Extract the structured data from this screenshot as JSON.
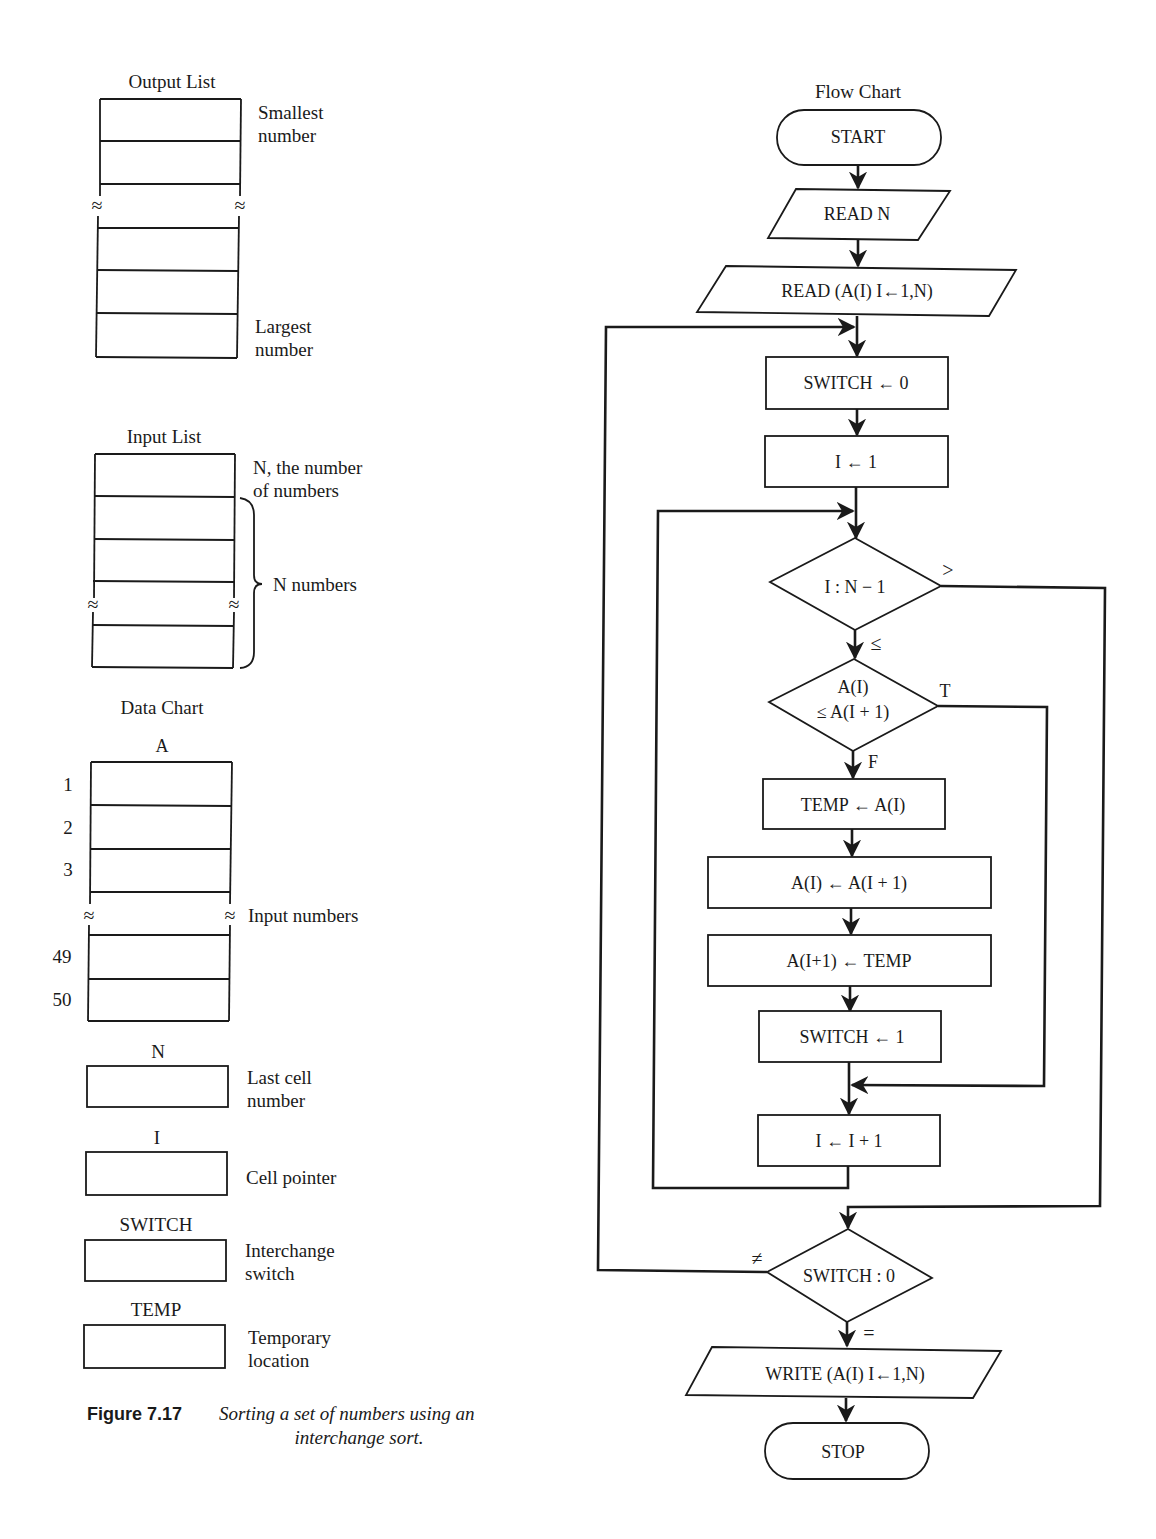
{
  "output_list": {
    "title": "Output List",
    "top_label": [
      "Smallest",
      "number"
    ],
    "bottom_label": [
      "Largest",
      "number"
    ],
    "break_symbol": "≈"
  },
  "input_list": {
    "title": "Input List",
    "first_label": [
      "N, the number",
      "of numbers"
    ],
    "brace_label": "N numbers",
    "break_symbol": "≈"
  },
  "data_chart": {
    "title": "Data Chart",
    "array_name": "A",
    "row_indices": [
      "1",
      "2",
      "3",
      "49",
      "50"
    ],
    "break_label": "Input numbers",
    "break_symbol": "≈",
    "variables": [
      {
        "name": "N",
        "label": [
          "Last cell",
          "number"
        ]
      },
      {
        "name": "I",
        "label": [
          "Cell pointer"
        ]
      },
      {
        "name": "SWITCH",
        "label": [
          "Interchange",
          "switch"
        ]
      },
      {
        "name": "TEMP",
        "label": [
          "Temporary",
          "location"
        ]
      }
    ]
  },
  "caption": {
    "figure_number": "Figure 7.17",
    "text_line1": "Sorting a set of numbers using an",
    "text_line2": "interchange sort."
  },
  "flow_chart": {
    "title": "Flow Chart",
    "start": "START",
    "read_n": "READ N",
    "read_a": "READ (A(I)  I←1,N)",
    "switch_zero": "SWITCH ← 0",
    "i_one": "I ← 1",
    "decision_i": "I : N − 1",
    "decision_i_gt": ">",
    "decision_i_le": "≤",
    "decision_a_line1": "A(I)",
    "decision_a_line2": "≤ A(I + 1)",
    "decision_a_true": "T",
    "decision_a_false": "F",
    "temp_assign": "TEMP ← A(I)",
    "a_assign": "A(I) ← A(I + 1)",
    "a_next_assign": "A(I+1) ← TEMP",
    "switch_one": "SWITCH ← 1",
    "i_increment": "I ← I + 1",
    "decision_switch": "SWITCH : 0",
    "decision_switch_ne": "≠",
    "decision_switch_eq": "=",
    "write_a": "WRITE (A(I)  I←1,N)",
    "stop": "STOP"
  }
}
